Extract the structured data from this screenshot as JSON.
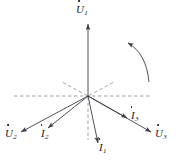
{
  "figure": {
    "background_color": "#ffffff",
    "line_color": "#3d3d45",
    "dashed_color": "#8a8a92",
    "label_color": "#1a1a1a",
    "origin": {
      "x": 88,
      "y": 96
    },
    "rotation_indicator": {
      "name": "counterclockwise-rotation-arc",
      "direction": "counterclockwise",
      "arrow_end": "upper-left"
    },
    "phasors": [
      {
        "id": "U1",
        "symbol": "U",
        "subscript": "1",
        "kind": "voltage",
        "label": "U̇1",
        "angle_deg": 90,
        "length_px": 74,
        "tip": {
          "x": 88,
          "y": 22
        },
        "label_pos": {
          "x": 78,
          "y": 5
        }
      },
      {
        "id": "U2",
        "symbol": "U",
        "subscript": "2",
        "kind": "voltage",
        "label": "U̇2",
        "angle_deg": 208,
        "length_px": 78,
        "tip": {
          "x": 19,
          "y": 133
        },
        "label_pos": {
          "x": 5,
          "y": 131
        }
      },
      {
        "id": "U3",
        "symbol": "U",
        "subscript": "3",
        "kind": "voltage",
        "label": "U̇3",
        "angle_deg": 332,
        "length_px": 74,
        "tip": {
          "x": 153,
          "y": 133
        },
        "label_pos": {
          "x": 155,
          "y": 131
        }
      },
      {
        "id": "I1",
        "symbol": "I",
        "subscript": "1",
        "kind": "current",
        "label": "İ1",
        "angle_deg": 283,
        "length_px": 52,
        "tip": {
          "x": 99,
          "y": 145
        },
        "label_pos": {
          "x": 99,
          "y": 143
        }
      },
      {
        "id": "I2",
        "symbol": "I",
        "subscript": "2",
        "kind": "current",
        "label": "İ2",
        "angle_deg": 216,
        "length_px": 52,
        "tip": {
          "x": 46,
          "y": 129
        },
        "label_pos": {
          "x": 41,
          "y": 131
        }
      },
      {
        "id": "I3",
        "symbol": "I",
        "subscript": "3",
        "kind": "current",
        "label": "İ3",
        "angle_deg": 338,
        "length_px": 48,
        "tip": {
          "x": 129,
          "y": 119
        },
        "label_pos": {
          "x": 130,
          "y": 112
        }
      }
    ],
    "reference_lines": [
      {
        "id": "axis-horizontal",
        "style": "dashed",
        "x1": 14,
        "y1": 96,
        "x2": 150,
        "y2": 96
      },
      {
        "id": "axis-vertical-down",
        "style": "dashed",
        "x1": 88,
        "y1": 96,
        "x2": 88,
        "y2": 140
      },
      {
        "id": "diagonal-upper-left",
        "style": "dashed",
        "x1": 88,
        "y1": 96,
        "x2": 64,
        "y2": 84
      },
      {
        "id": "diagonal-upper-right",
        "style": "dashed",
        "x1": 88,
        "y1": 96,
        "x2": 112,
        "y2": 84
      }
    ]
  }
}
